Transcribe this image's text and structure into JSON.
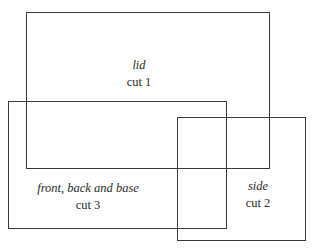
{
  "diagram": {
    "pieces": [
      {
        "name": "lid",
        "cut": "cut 1"
      },
      {
        "name": "side",
        "cut": "cut 2"
      },
      {
        "name": "front, back and base",
        "cut": "cut 3"
      }
    ]
  }
}
